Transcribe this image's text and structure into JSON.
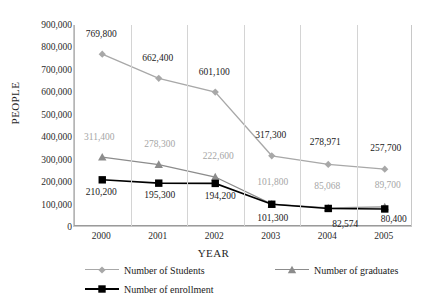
{
  "chart_data": {
    "type": "line",
    "title": "",
    "xlabel": "YEAR",
    "ylabel": "PEOPLE",
    "categories": [
      "2000",
      "2001",
      "2002",
      "2003",
      "2004",
      "2005"
    ],
    "ylim": [
      0,
      900000
    ],
    "ytick_values": [
      900000,
      800000,
      700000,
      600000,
      500000,
      400000,
      300000,
      200000,
      100000,
      0
    ],
    "ytick_labels": [
      "900,000",
      "800,000",
      "700,000",
      "600,000",
      "500,000",
      "400,000",
      "300,000",
      "200,000",
      "100,000",
      "0"
    ],
    "grid": "vertical",
    "legend_position": "bottom",
    "series": [
      {
        "name": "Number of Students",
        "marker": "diamond",
        "color": "#a8a8a8",
        "values": [
          769800,
          662400,
          601100,
          317300,
          278971,
          257700
        ],
        "labels": [
          "769,800",
          "662,400",
          "601,100",
          "317,300",
          "278,971",
          "257,700"
        ],
        "label_color": "#1a1a1a"
      },
      {
        "name": "Number of graduates",
        "marker": "triangle",
        "color": "#8c8c8c",
        "values": [
          311400,
          278300,
          222600,
          101800,
          85068,
          89700
        ],
        "labels": [
          "311,400",
          "278,300",
          "222,600",
          "101,800",
          "85,068",
          "89,700"
        ],
        "label_color": "#a6a6a6"
      },
      {
        "name": "Number of enrollment",
        "marker": "square",
        "color": "#000000",
        "values": [
          210200,
          195300,
          194200,
          101300,
          82574,
          80400
        ],
        "labels": [
          "210,200",
          "195,300",
          "194,200",
          "101,300",
          "82,574",
          "80,400"
        ],
        "label_color": "#1a1a1a"
      }
    ]
  },
  "axes": {
    "y_title": "PEOPLE",
    "x_title": "YEAR"
  },
  "legend": {
    "items": [
      {
        "label": "Number of Students",
        "marker": "diamond-marker",
        "color": "#a8a8a8"
      },
      {
        "label": "Number of graduates",
        "marker": "triangle-marker",
        "color": "#8c8c8c"
      },
      {
        "label": "Number of enrollment",
        "marker": "square-marker",
        "color": "#000000"
      }
    ]
  }
}
